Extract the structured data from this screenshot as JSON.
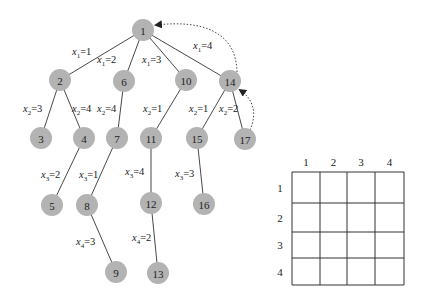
{
  "tree": {
    "nodes": [
      {
        "id": "1",
        "x": 143,
        "y": 30
      },
      {
        "id": "2",
        "x": 60,
        "y": 80
      },
      {
        "id": "6",
        "x": 124,
        "y": 81
      },
      {
        "id": "10",
        "x": 186,
        "y": 80
      },
      {
        "id": "14",
        "x": 230,
        "y": 81
      },
      {
        "id": "3",
        "x": 41,
        "y": 138
      },
      {
        "id": "4",
        "x": 84,
        "y": 138
      },
      {
        "id": "7",
        "x": 117,
        "y": 138
      },
      {
        "id": "11",
        "x": 151,
        "y": 138
      },
      {
        "id": "15",
        "x": 197,
        "y": 138
      },
      {
        "id": "17",
        "x": 245,
        "y": 139
      },
      {
        "id": "5",
        "x": 52,
        "y": 205
      },
      {
        "id": "8",
        "x": 87,
        "y": 205
      },
      {
        "id": "12",
        "x": 151,
        "y": 203
      },
      {
        "id": "16",
        "x": 204,
        "y": 204
      },
      {
        "id": "9",
        "x": 116,
        "y": 272
      },
      {
        "id": "13",
        "x": 158,
        "y": 273
      }
    ],
    "edges": [
      {
        "from": "1",
        "to": "2",
        "var": "x",
        "sub": "1",
        "val": "1",
        "lx": 72,
        "ly": 55
      },
      {
        "from": "1",
        "to": "6",
        "var": "x",
        "sub": "1",
        "val": "2",
        "lx": 97,
        "ly": 63
      },
      {
        "from": "1",
        "to": "10",
        "var": "x",
        "sub": "1",
        "val": "3",
        "lx": 142,
        "ly": 63
      },
      {
        "from": "1",
        "to": "14",
        "var": "x",
        "sub": "1",
        "val": "4",
        "lx": 193,
        "ly": 49
      },
      {
        "from": "2",
        "to": "3",
        "var": "x",
        "sub": "2",
        "val": "3",
        "lx": 23,
        "ly": 112
      },
      {
        "from": "2",
        "to": "4",
        "var": "x",
        "sub": "2",
        "val": "4",
        "lx": 72,
        "ly": 112
      },
      {
        "from": "6",
        "to": "7",
        "var": "x",
        "sub": "2",
        "val": "4",
        "lx": 97,
        "ly": 112
      },
      {
        "from": "10",
        "to": "11",
        "var": "x",
        "sub": "2",
        "val": "1",
        "lx": 143,
        "ly": 112
      },
      {
        "from": "14",
        "to": "15",
        "var": "x",
        "sub": "2",
        "val": "1",
        "lx": 189,
        "ly": 112
      },
      {
        "from": "14",
        "to": "17",
        "var": "x",
        "sub": "2",
        "val": "2",
        "lx": 219,
        "ly": 112
      },
      {
        "from": "4",
        "to": "5",
        "var": "x",
        "sub": "3",
        "val": "2",
        "lx": 41,
        "ly": 178
      },
      {
        "from": "7",
        "to": "8",
        "var": "x",
        "sub": "3",
        "val": "1",
        "lx": 79,
        "ly": 178
      },
      {
        "from": "11",
        "to": "12",
        "var": "x",
        "sub": "3",
        "val": "4",
        "lx": 125,
        "ly": 175
      },
      {
        "from": "15",
        "to": "16",
        "var": "x",
        "sub": "3",
        "val": "3",
        "lx": 175,
        "ly": 177
      },
      {
        "from": "8",
        "to": "9",
        "var": "x",
        "sub": "4",
        "val": "3",
        "lx": 76,
        "ly": 245
      },
      {
        "from": "12",
        "to": "13",
        "var": "x",
        "sub": "4",
        "val": "2",
        "lx": 132,
        "ly": 241
      }
    ],
    "backtrack_arrows": [
      {
        "from": "14",
        "to": "1",
        "style": "dotted"
      },
      {
        "from": "17",
        "to": "14",
        "style": "dotted"
      }
    ]
  },
  "board": {
    "size": 4,
    "column_labels": [
      "1",
      "2",
      "3",
      "4"
    ],
    "row_labels": [
      "1",
      "2",
      "3",
      "4"
    ],
    "col_lines": [
      292,
      320,
      347,
      375,
      404
    ],
    "row_lines": [
      172,
      203,
      232,
      258,
      285
    ]
  },
  "colors": {
    "node_fill": "#b3b3b3",
    "line": "#333333",
    "background": "#ffffff"
  }
}
